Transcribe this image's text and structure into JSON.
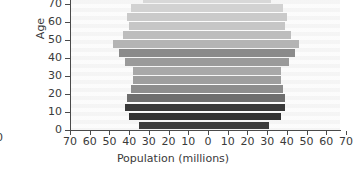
{
  "ghost": {
    "clipped_label": "0"
  },
  "axes": {
    "ylabel": "Age",
    "xlabel": "Population (millions)",
    "xticks": [
      70,
      60,
      50,
      40,
      30,
      20,
      10,
      0,
      10,
      20,
      30,
      40,
      50,
      60,
      70
    ],
    "yticks": [
      0,
      10,
      20,
      30,
      40,
      50,
      60,
      70
    ]
  },
  "chart_data": {
    "type": "bar",
    "subtype": "population-pyramid",
    "title": "",
    "xlabel": "Population (millions)",
    "ylabel": "Age",
    "xlim": [
      -70,
      70
    ],
    "ylim": [
      0,
      72
    ],
    "xtick_labels": [
      "70",
      "60",
      "50",
      "40",
      "30",
      "20",
      "10",
      "0",
      "10",
      "20",
      "30",
      "40",
      "50",
      "60",
      "70"
    ],
    "ytick_labels": [
      "0",
      "10",
      "20",
      "30",
      "40",
      "50",
      "60",
      "70"
    ],
    "grid": false,
    "legend": null,
    "note": "Symmetric pyramid; left side and right side plotted as mirrored magnitudes in millions. Top of plot is clipped at about age 72.",
    "categories": [
      "0-4",
      "5-9",
      "10-14",
      "15-19",
      "20-24",
      "25-29",
      "30-34",
      "35-39",
      "40-44",
      "45-49",
      "50-54",
      "55-59",
      "60-64",
      "65-69",
      "70-74"
    ],
    "series": [
      {
        "name": "left",
        "values": [
          35,
          40,
          42,
          41,
          39,
          38,
          38,
          42,
          45,
          48,
          43,
          40,
          41,
          39,
          33
        ]
      },
      {
        "name": "right",
        "values": [
          31,
          37,
          39,
          39,
          38,
          37,
          37,
          41,
          44,
          46,
          42,
          39,
          40,
          38,
          32
        ]
      }
    ],
    "bar_shades": [
      "#3c3c3c",
      "#333333",
      "#3a3a3a",
      "#6e6e6e",
      "#8d8d8d",
      "#9e9e9e",
      "#a8a8a8",
      "#9a9a9a",
      "#8a8a8a",
      "#b4b4b4",
      "#bdbdbd",
      "#c6c6c6",
      "#cacaca",
      "#d2d2d2",
      "#d8d8d8"
    ]
  },
  "colors": {
    "zero_line": "#1a1a1a",
    "axis": "#4a4a4a",
    "text": "#3a3a3a",
    "background": "#ffffff"
  }
}
